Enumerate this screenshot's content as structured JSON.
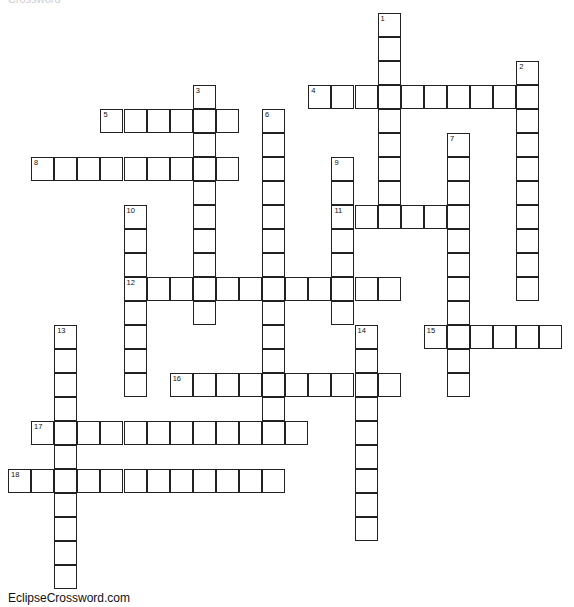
{
  "puzzle": {
    "top_cutoff_text": "Crossword",
    "footer": "EclipseCrossword.com",
    "cell_width": 23.1,
    "cell_height": 24,
    "origin_x": 8,
    "origin_y": 13,
    "words": [
      {
        "number": "1",
        "direction": "down",
        "row": 0,
        "col": 16,
        "length": 9
      },
      {
        "number": "2",
        "direction": "down",
        "row": 2,
        "col": 22,
        "length": 10
      },
      {
        "number": "3",
        "direction": "down",
        "row": 3,
        "col": 8,
        "length": 10
      },
      {
        "number": "4",
        "direction": "across",
        "row": 3,
        "col": 13,
        "length": 10
      },
      {
        "number": "5",
        "direction": "across",
        "row": 4,
        "col": 4,
        "length": 6
      },
      {
        "number": "6",
        "direction": "down",
        "row": 4,
        "col": 11,
        "length": 14
      },
      {
        "number": "7",
        "direction": "down",
        "row": 5,
        "col": 19,
        "length": 11
      },
      {
        "number": "8",
        "direction": "across",
        "row": 6,
        "col": 1,
        "length": 9
      },
      {
        "number": "9",
        "direction": "down",
        "row": 6,
        "col": 14,
        "length": 7
      },
      {
        "number": "10",
        "direction": "down",
        "row": 8,
        "col": 5,
        "length": 8
      },
      {
        "number": "11",
        "direction": "across",
        "row": 8,
        "col": 14,
        "length": 6
      },
      {
        "number": "12",
        "direction": "across",
        "row": 11,
        "col": 5,
        "length": 12
      },
      {
        "number": "13",
        "direction": "down",
        "row": 13,
        "col": 2,
        "length": 11
      },
      {
        "number": "14",
        "direction": "down",
        "row": 13,
        "col": 15,
        "length": 9
      },
      {
        "number": "15",
        "direction": "across",
        "row": 13,
        "col": 18,
        "length": 6
      },
      {
        "number": "16",
        "direction": "across",
        "row": 15,
        "col": 7,
        "length": 10
      },
      {
        "number": "17",
        "direction": "across",
        "row": 17,
        "col": 1,
        "length": 12
      },
      {
        "number": "18",
        "direction": "across",
        "row": 19,
        "col": 0,
        "length": 12
      }
    ]
  }
}
